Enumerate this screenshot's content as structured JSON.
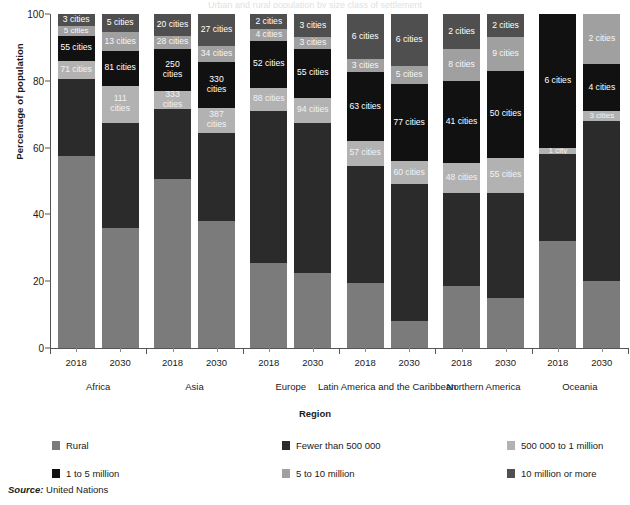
{
  "top_title": "Urban and rural population by size class of settlement",
  "axes": {
    "ylabel": "Percentage of population",
    "xlabel": "Region",
    "yticks": [
      "0",
      "20",
      "40",
      "60",
      "80",
      "100"
    ]
  },
  "source": {
    "prefix": "Source:",
    "text": " United Nations"
  },
  "legend": [
    {
      "label": "Rural",
      "color": "#7b7b7b"
    },
    {
      "label": "Fewer than 500 000",
      "color": "#2b2b2b"
    },
    {
      "label": "500 000 to 1 million",
      "color": "#b2b2b2"
    },
    {
      "label": "1 to 5 million",
      "color": "#111111"
    },
    {
      "label": "5 to 10 million",
      "color": "#a0a0a0"
    },
    {
      "label": "10 million or more",
      "color": "#4f4f4f"
    }
  ],
  "chart_data": {
    "type": "bar",
    "subtype": "stacked-bar-100",
    "title": "Urban and rural population by size class of settlement",
    "xlabel": "Region",
    "ylabel": "Percentage of population",
    "ylim": [
      0,
      100
    ],
    "yticks": [
      0,
      20,
      40,
      60,
      80,
      100
    ],
    "grid": false,
    "legend_position": "bottom",
    "categories": [
      "Africa 2018",
      "Africa 2030",
      "Asia 2018",
      "Asia 2030",
      "Europe 2018",
      "Europe 2030",
      "Latin America and the Caribbean 2018",
      "Latin America and the Caribbean 2030",
      "Northern America 2018",
      "Northern America 2030",
      "Oceania 2018",
      "Oceania 2030"
    ],
    "regions": [
      "Africa",
      "Asia",
      "Europe",
      "Latin America and the Caribbean",
      "Northern America",
      "Oceania"
    ],
    "years": [
      "2018",
      "2030"
    ],
    "series": [
      {
        "name": "Rural",
        "color": "#7b7b7b",
        "values": [
          57.5,
          36.0,
          50.5,
          38.0,
          25.5,
          22.5,
          19.5,
          8.0,
          18.5,
          15.0,
          32.0,
          20.0
        ]
      },
      {
        "name": "Fewer than 500 000",
        "color": "#2b2b2b",
        "values": [
          23.0,
          31.5,
          21.0,
          26.5,
          45.5,
          45.0,
          35.0,
          41.0,
          28.0,
          31.5,
          26.0,
          48.0
        ]
      },
      {
        "name": "500 000 to 1 million",
        "color": "#b2b2b2",
        "values": [
          5.5,
          11.0,
          5.5,
          7.5,
          7.0,
          7.5,
          7.5,
          7.0,
          9.0,
          10.5,
          2.0,
          3.0
        ]
      },
      {
        "name": "1 to 5 million",
        "color": "#111111",
        "values": [
          7.5,
          10.5,
          12.5,
          13.5,
          14.0,
          14.5,
          20.5,
          23.0,
          24.5,
          26.0,
          40.0,
          14.0
        ]
      },
      {
        "name": "5 to 10 million",
        "color": "#a0a0a0",
        "values": [
          3.0,
          5.5,
          4.0,
          5.0,
          3.5,
          3.5,
          4.0,
          5.5,
          9.5,
          10.0,
          0.0,
          15.0
        ]
      },
      {
        "name": "10 million or more",
        "color": "#4f4f4f",
        "values": [
          3.5,
          5.5,
          6.5,
          9.5,
          4.5,
          7.0,
          13.5,
          15.5,
          10.5,
          7.0,
          0.0,
          0.0
        ]
      }
    ],
    "city_counts": {
      "Fewer than 500 000": [
        "",
        "",
        "",
        "",
        "",
        "",
        "",
        "",
        "",
        "",
        "",
        ""
      ],
      "500 000 to 1 million": [
        "71 cities",
        "111 cities",
        "333 cities",
        "387 cities",
        "88 cities",
        "94 cities",
        "57 cities",
        "60 cities",
        "48 cities",
        "55 cities",
        "1 city",
        "3 cities"
      ],
      "1 to 5 million": [
        "55 cities",
        "81 cities",
        "250 cities",
        "330 cities",
        "52 cities",
        "55 cities",
        "63 cities",
        "77 cities",
        "41 cities",
        "50 cities",
        "6 cities",
        "4 cities"
      ],
      "5 to 10 million": [
        "5 cities",
        "13 cities",
        "28 cities",
        "34 cities",
        "4 cities",
        "3 cities",
        "3 cities",
        "5 cities",
        "8 cities",
        "9 cities",
        "",
        "2 cities"
      ],
      "10 million or more": [
        "3 cities",
        "5 cities",
        "20 cities",
        "27 cities",
        "2 cities",
        "3 cities",
        "6 cities",
        "6 cities",
        "2 cities",
        "2 cities",
        "",
        ""
      ]
    }
  },
  "bars": [
    {
      "region": "Africa",
      "year": "2018",
      "segments": [
        {
          "cat": "Rural",
          "pct": 57.5,
          "label": ""
        },
        {
          "cat": "Fewer than 500 000",
          "pct": 23.0,
          "label": ""
        },
        {
          "cat": "500 000 to 1 million",
          "pct": 5.5,
          "label": "71 cities"
        },
        {
          "cat": "1 to 5 million",
          "pct": 7.5,
          "label": "55 cities"
        },
        {
          "cat": "5 to 10 million",
          "pct": 3.0,
          "label": "5 cities"
        },
        {
          "cat": "10 million or more",
          "pct": 3.5,
          "label": "3 cities"
        }
      ]
    },
    {
      "region": "Africa",
      "year": "2030",
      "segments": [
        {
          "cat": "Rural",
          "pct": 36.0,
          "label": ""
        },
        {
          "cat": "Fewer than 500 000",
          "pct": 31.5,
          "label": ""
        },
        {
          "cat": "500 000 to 1 million",
          "pct": 11.0,
          "label": "111 cities"
        },
        {
          "cat": "1 to 5 million",
          "pct": 10.5,
          "label": "81 cities"
        },
        {
          "cat": "5 to 10 million",
          "pct": 5.5,
          "label": "13 cities"
        },
        {
          "cat": "10 million or more",
          "pct": 5.5,
          "label": "5 cities"
        }
      ]
    },
    {
      "region": "Asia",
      "year": "2018",
      "segments": [
        {
          "cat": "Rural",
          "pct": 50.5,
          "label": ""
        },
        {
          "cat": "Fewer than 500 000",
          "pct": 21.0,
          "label": ""
        },
        {
          "cat": "500 000 to 1 million",
          "pct": 5.5,
          "label": "333 cities"
        },
        {
          "cat": "1 to 5 million",
          "pct": 12.5,
          "label": "250 cities"
        },
        {
          "cat": "5 to 10 million",
          "pct": 4.0,
          "label": "28 cities"
        },
        {
          "cat": "10 million or more",
          "pct": 6.5,
          "label": "20 cities"
        }
      ]
    },
    {
      "region": "Asia",
      "year": "2030",
      "segments": [
        {
          "cat": "Rural",
          "pct": 38.0,
          "label": ""
        },
        {
          "cat": "Fewer than 500 000",
          "pct": 26.5,
          "label": ""
        },
        {
          "cat": "500 000 to 1 million",
          "pct": 7.5,
          "label": "387 cities"
        },
        {
          "cat": "1 to 5 million",
          "pct": 13.5,
          "label": "330 cities"
        },
        {
          "cat": "5 to 10 million",
          "pct": 5.0,
          "label": "34 cities"
        },
        {
          "cat": "10 million or more",
          "pct": 9.5,
          "label": "27 cities"
        }
      ]
    },
    {
      "region": "Europe",
      "year": "2018",
      "segments": [
        {
          "cat": "Rural",
          "pct": 25.5,
          "label": ""
        },
        {
          "cat": "Fewer than 500 000",
          "pct": 45.5,
          "label": ""
        },
        {
          "cat": "500 000 to 1 million",
          "pct": 7.0,
          "label": "88 cities"
        },
        {
          "cat": "1 to 5 million",
          "pct": 14.0,
          "label": "52 cities"
        },
        {
          "cat": "5 to 10 million",
          "pct": 3.5,
          "label": "4 cities"
        },
        {
          "cat": "10 million or more",
          "pct": 4.5,
          "label": "2 cities"
        }
      ]
    },
    {
      "region": "Europe",
      "year": "2030",
      "segments": [
        {
          "cat": "Rural",
          "pct": 22.5,
          "label": ""
        },
        {
          "cat": "Fewer than 500 000",
          "pct": 45.0,
          "label": ""
        },
        {
          "cat": "500 000 to 1 million",
          "pct": 7.5,
          "label": "94 cities"
        },
        {
          "cat": "1 to 5 million",
          "pct": 14.5,
          "label": "55 cities"
        },
        {
          "cat": "5 to 10 million",
          "pct": 3.5,
          "label": "3 cities"
        },
        {
          "cat": "10 million or more",
          "pct": 7.0,
          "label": "3 cities"
        }
      ]
    },
    {
      "region": "Latin America and the Caribbean",
      "year": "2018",
      "segments": [
        {
          "cat": "Rural",
          "pct": 19.5,
          "label": ""
        },
        {
          "cat": "Fewer than 500 000",
          "pct": 35.0,
          "label": ""
        },
        {
          "cat": "500 000 to 1 million",
          "pct": 7.5,
          "label": "57 cities"
        },
        {
          "cat": "1 to 5 million",
          "pct": 20.5,
          "label": "63 cities"
        },
        {
          "cat": "5 to 10 million",
          "pct": 4.0,
          "label": "3 cities"
        },
        {
          "cat": "10 million or more",
          "pct": 13.5,
          "label": "6 cities"
        }
      ]
    },
    {
      "region": "Latin America and the Caribbean",
      "year": "2030",
      "segments": [
        {
          "cat": "Rural",
          "pct": 8.0,
          "label": ""
        },
        {
          "cat": "Fewer than 500 000",
          "pct": 41.0,
          "label": ""
        },
        {
          "cat": "500 000 to 1 million",
          "pct": 7.0,
          "label": "60 cities"
        },
        {
          "cat": "1 to 5 million",
          "pct": 23.0,
          "label": "77 cities"
        },
        {
          "cat": "5 to 10 million",
          "pct": 5.5,
          "label": "5 cities"
        },
        {
          "cat": "10 million or more",
          "pct": 15.5,
          "label": "6 cities"
        }
      ]
    },
    {
      "region": "Northern America",
      "year": "2018",
      "segments": [
        {
          "cat": "Rural",
          "pct": 18.5,
          "label": ""
        },
        {
          "cat": "Fewer than 500 000",
          "pct": 28.0,
          "label": ""
        },
        {
          "cat": "500 000 to 1 million",
          "pct": 9.0,
          "label": "48 cities"
        },
        {
          "cat": "1 to 5 million",
          "pct": 24.5,
          "label": "41 cities"
        },
        {
          "cat": "5 to 10 million",
          "pct": 9.5,
          "label": "8 cities"
        },
        {
          "cat": "10 million or more",
          "pct": 10.5,
          "label": "2 cities"
        }
      ]
    },
    {
      "region": "Northern America",
      "year": "2030",
      "segments": [
        {
          "cat": "Rural",
          "pct": 15.0,
          "label": ""
        },
        {
          "cat": "Fewer than 500 000",
          "pct": 31.5,
          "label": ""
        },
        {
          "cat": "500 000 to 1 million",
          "pct": 10.5,
          "label": "55 cities"
        },
        {
          "cat": "1 to 5 million",
          "pct": 26.0,
          "label": "50 cities"
        },
        {
          "cat": "5 to 10 million",
          "pct": 10.0,
          "label": "9 cities"
        },
        {
          "cat": "10 million or more",
          "pct": 7.0,
          "label": "2 cities"
        }
      ]
    },
    {
      "region": "Oceania",
      "year": "2018",
      "segments": [
        {
          "cat": "Rural",
          "pct": 32.0,
          "label": ""
        },
        {
          "cat": "Fewer than 500 000",
          "pct": 26.0,
          "label": ""
        },
        {
          "cat": "500 000 to 1 million",
          "pct": 2.0,
          "label": "1 city"
        },
        {
          "cat": "1 to 5 million",
          "pct": 40.0,
          "label": "6 cities"
        },
        {
          "cat": "5 to 10 million",
          "pct": 0.0,
          "label": ""
        },
        {
          "cat": "10 million or more",
          "pct": 0.0,
          "label": ""
        }
      ]
    },
    {
      "region": "Oceania",
      "year": "2030",
      "segments": [
        {
          "cat": "Rural",
          "pct": 20.0,
          "label": ""
        },
        {
          "cat": "Fewer than 500 000",
          "pct": 48.0,
          "label": ""
        },
        {
          "cat": "500 000 to 1 million",
          "pct": 3.0,
          "label": "3 cities"
        },
        {
          "cat": "1 to 5 million",
          "pct": 14.0,
          "label": "4 cities"
        },
        {
          "cat": "5 to 10 million",
          "pct": 15.0,
          "label": "2 cities"
        },
        {
          "cat": "10 million or more",
          "pct": 0.0,
          "label": ""
        }
      ]
    }
  ]
}
